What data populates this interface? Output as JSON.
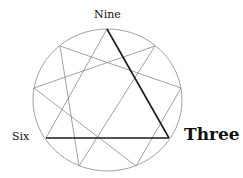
{
  "diagram": {
    "type": "enneagram",
    "labels": {
      "nine": "Nine",
      "six": "Six",
      "three": "Three"
    },
    "highlighted_edges": [
      [
        "Nine",
        "Three"
      ],
      [
        "Three",
        "Six"
      ]
    ],
    "colors": {
      "thin_line": "#8a8a8a",
      "thick_line": "#1a1a1a"
    }
  }
}
